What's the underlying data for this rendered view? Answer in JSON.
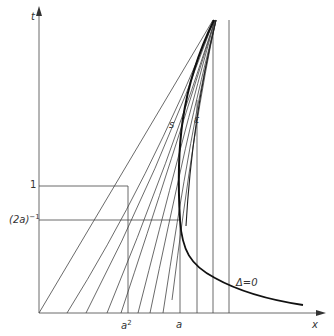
{
  "figure": {
    "axes": {
      "x_label": "x",
      "t_label": "t"
    },
    "y_ticks": {
      "one": "1",
      "inv_2a_base": "(2a)",
      "inv_2a_exp": "−1"
    },
    "x_ticks": {
      "a_squared_base": "a",
      "a_squared_exp": "2",
      "a": "a"
    },
    "curve_labels": {
      "s": "s",
      "epsilon": "ε",
      "delta_zero": "Δ=0"
    },
    "colors": {
      "ink": "#333333",
      "bold_ink": "#1a1a1a",
      "background": "#ffffff"
    }
  }
}
